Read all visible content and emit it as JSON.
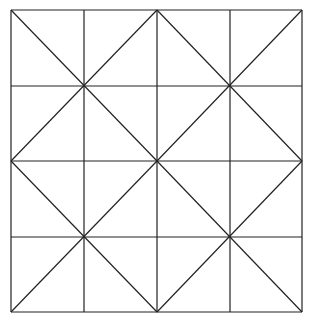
{
  "diagram": {
    "stroke_color": "#222222",
    "background": "#ffffff",
    "bounds": {
      "x0": 11,
      "y0": 10,
      "x1": 302,
      "y1": 312
    },
    "grid_x": [
      11,
      84,
      157,
      230,
      302
    ],
    "grid_y": [
      10,
      86,
      161,
      237,
      312
    ],
    "diagonals": [
      [
        11,
        10,
        157,
        161
      ],
      [
        157,
        10,
        11,
        161
      ],
      [
        157,
        10,
        302,
        161
      ],
      [
        302,
        10,
        157,
        161
      ],
      [
        11,
        161,
        157,
        312
      ],
      [
        157,
        161,
        11,
        312
      ],
      [
        157,
        161,
        302,
        312
      ],
      [
        302,
        161,
        157,
        312
      ]
    ]
  }
}
